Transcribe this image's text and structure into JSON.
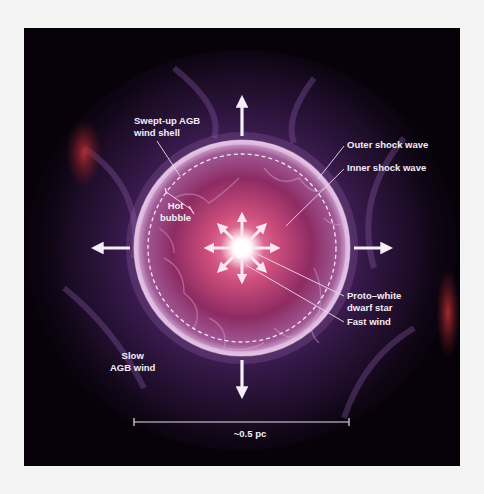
{
  "diagram": {
    "labels": {
      "swept_up_shell": [
        "Swept-up AGB",
        "wind shell"
      ],
      "hot_bubble": [
        "Hot",
        "bubble"
      ],
      "outer_shock": "Outer shock wave",
      "inner_shock": "Inner shock wave",
      "proto_white_dwarf": [
        "Proto–white",
        "dwarf star"
      ],
      "fast_wind": "Fast wind",
      "slow_wind": [
        "Slow",
        "AGB wind"
      ]
    },
    "scale_bar": {
      "label": "~0.5 pc"
    },
    "arrows": {
      "outer": [
        "up",
        "down",
        "left",
        "right"
      ],
      "inner_fast_wind": [
        "up",
        "up-right",
        "right",
        "down-right",
        "down",
        "down-left",
        "left",
        "up-left"
      ]
    },
    "colors": {
      "background": "#07020a",
      "nebula_purple": "#5a2a78",
      "shell_pink": "#d9a7d8",
      "bubble_red": "#c0346a",
      "star_white": "#ffffff",
      "label_text": "#f3eef5",
      "red_filaments": "#b5282f"
    }
  }
}
